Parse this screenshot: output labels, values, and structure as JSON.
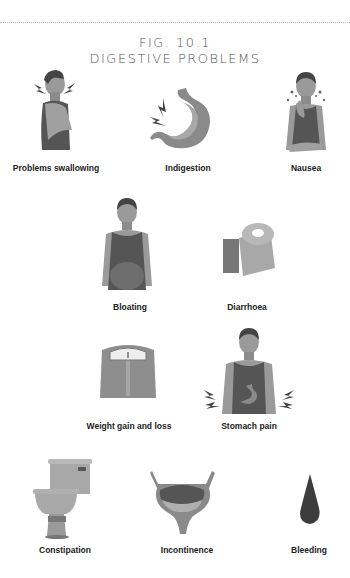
{
  "figure": {
    "number": "FIG. 10.1",
    "title": "DIGESTIVE PROBLEMS"
  },
  "colors": {
    "skin": "#9a9a9a",
    "skin_light": "#b0b0b0",
    "shirt": "#555555",
    "dark": "#3d3d3d",
    "object": "#a5a5a5",
    "dotted_rule": "#b8b8b8"
  },
  "items": [
    {
      "label": "Problems swallowing",
      "icon": "man-throat-pain-icon"
    },
    {
      "label": "Indigestion",
      "icon": "stomach-lightning-icon"
    },
    {
      "label": "Nausea",
      "icon": "man-dizzy-icon"
    },
    {
      "label": "Bloating",
      "icon": "man-bloated-belly-icon"
    },
    {
      "label": "Diarrhoea",
      "icon": "toilet-roll-icon"
    },
    {
      "label": "Weight gain and loss",
      "icon": "bathroom-scale-icon"
    },
    {
      "label": "Stomach pain",
      "icon": "man-stomach-pain-icon"
    },
    {
      "label": "Constipation",
      "icon": "toilet-icon"
    },
    {
      "label": "Incontinence",
      "icon": "bladder-icon"
    },
    {
      "label": "Bleeding",
      "icon": "blood-drop-icon"
    }
  ]
}
